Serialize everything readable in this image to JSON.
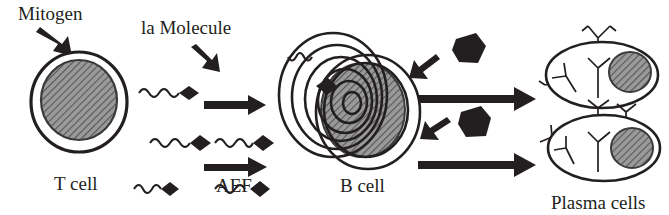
{
  "figure": {
    "background_color": "#ffffff",
    "ink_color": "#231f20",
    "nucleus_fill": "#8c8c8c",
    "width": 669,
    "height": 215
  },
  "labels": {
    "mitogen": "Mitogen",
    "ia_molecule": "la Molecule",
    "t_cell": "T cell",
    "aef": "AEF",
    "b_cell": "B cell",
    "plasma_cells": "Plasma cells"
  },
  "cells": [
    {
      "id": "t-cell",
      "label": "T cell",
      "shape": "circle-with-nucleus",
      "nucleus_pattern": "diagonal-hatch"
    },
    {
      "id": "b-cell",
      "label": "B cell",
      "shape": "concentric-rings-with-nucleus",
      "ring_count": 6,
      "nucleus_pattern": "diagonal-hatch"
    },
    {
      "id": "plasma-cell-upper",
      "label": "Plasma cells",
      "shape": "ellipse-with-nucleus",
      "nucleus_pattern": "diagonal-hatch"
    },
    {
      "id": "plasma-cell-lower",
      "label": "Plasma cells",
      "shape": "ellipse-with-nucleus",
      "nucleus_pattern": "diagonal-hatch"
    }
  ],
  "symbols": {
    "molecule": "squiggle-with-black-diamond-head",
    "antibody": "y-shaped-antibody",
    "blob": "irregular-black-blob",
    "arrow_thick": "thick-block-arrow-right",
    "arrow_diagonal": "diagonal-block-arrow"
  },
  "counts": {
    "ia_molecules_left_column": 3,
    "aef_molecules_right_column": 2,
    "horizontal_arrows_middle": 2,
    "horizontal_arrows_right": 2,
    "diagonal_arrows_right": 2,
    "black_blobs": 2,
    "plasma_cells": 2
  },
  "flow": [
    {
      "from": "Mitogen",
      "to": "T cell"
    },
    {
      "from": "T cell",
      "to": "la Molecule / AEF"
    },
    {
      "from": "AEF",
      "to": "B cell"
    },
    {
      "from": "B cell",
      "to": "Plasma cells"
    }
  ]
}
